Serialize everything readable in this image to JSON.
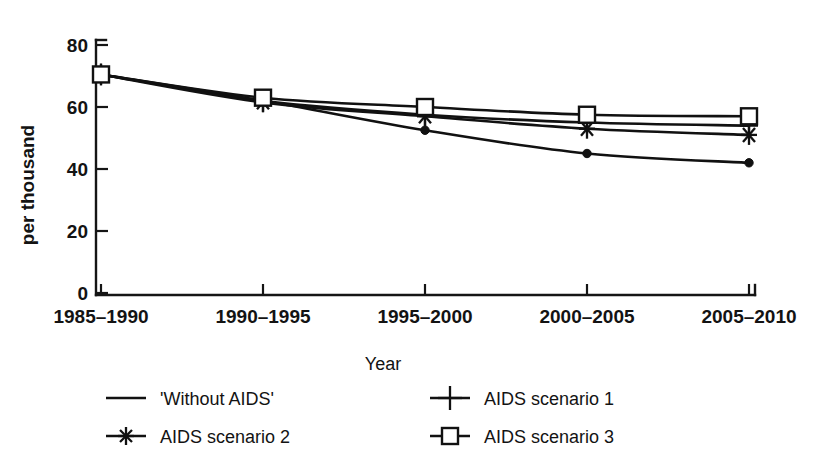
{
  "chart_data": {
    "type": "line",
    "title": "",
    "xlabel": "Year",
    "ylabel": "per thousand",
    "categories": [
      "1985–1990",
      "1990–1995",
      "1995–2000",
      "2000–2005",
      "2005–2010"
    ],
    "ylim": [
      0,
      80
    ],
    "yticks": [
      0,
      20,
      40,
      60,
      80
    ],
    "ytick_labels": [
      "0",
      "20",
      "40",
      "60",
      "80"
    ],
    "grid": false,
    "legend_position": "below-plot",
    "series": [
      {
        "name": "'Without AIDS'",
        "marker": "dot",
        "legend_marker": "none",
        "values": [
          70.5,
          62.0,
          52.5,
          45.0,
          42.0
        ]
      },
      {
        "name": "AIDS scenario 1",
        "marker": "plus",
        "legend_marker": "plus",
        "values": [
          70.5,
          62.0,
          57.5,
          55.0,
          54.0
        ]
      },
      {
        "name": "AIDS scenario 2",
        "marker": "star",
        "legend_marker": "star",
        "values": [
          70.5,
          61.5,
          57.0,
          53.0,
          51.0
        ]
      },
      {
        "name": "AIDS scenario 3",
        "marker": "square",
        "legend_marker": "square",
        "values": [
          70.5,
          63.0,
          60.0,
          57.5,
          57.0
        ]
      }
    ]
  },
  "axes": {
    "y_tick_0": "0",
    "y_tick_20": "20",
    "y_tick_40": "40",
    "y_tick_60": "60",
    "y_tick_80": "80",
    "y_axis_label": "per thousand",
    "x_axis_label": "Year",
    "x_tick_1": "1985–1990",
    "x_tick_2": "1990–1995",
    "x_tick_3": "1995–2000",
    "x_tick_4": "2000–2005",
    "x_tick_5": "2005–2010"
  },
  "legend": {
    "entries": [
      {
        "label": "'Without AIDS'",
        "marker": "line"
      },
      {
        "label": "AIDS scenario 1",
        "marker": "plus-icon"
      },
      {
        "label": "AIDS scenario 2",
        "marker": "star-icon"
      },
      {
        "label": "AIDS scenario 3",
        "marker": "square-icon"
      }
    ]
  },
  "colors": {
    "ink": "#111111",
    "background": "#ffffff"
  }
}
